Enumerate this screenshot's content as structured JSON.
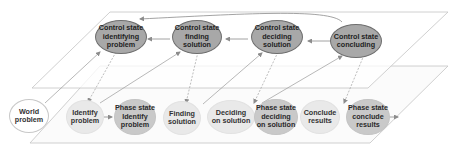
{
  "diagram": {
    "colors": {
      "control_fill": "#a8a8a8",
      "control_border": "#6e6e6e",
      "action_fill": "#e9e9e9",
      "phase_fill": "#c9c9c9",
      "world_fill": "#ffffff",
      "plane_stroke": "#c4c4c4",
      "arrow_stroke": "#8c8c8c"
    },
    "planes": [
      {
        "name": "control-plane",
        "label": ""
      },
      {
        "name": "phase-plane",
        "label": ""
      }
    ],
    "control_nodes": [
      {
        "id": "c1",
        "label": "Control state\nidentifying\nproblem"
      },
      {
        "id": "c2",
        "label": "Control state\nfinding\nsolution"
      },
      {
        "id": "c3",
        "label": "Control state\ndeciding\nsolution"
      },
      {
        "id": "c4",
        "label": "Control state\nconcluding"
      }
    ],
    "lower_nodes": [
      {
        "id": "w",
        "label": "World\nproblem",
        "kind": "world"
      },
      {
        "id": "a1",
        "label": "Identify\nproblem",
        "kind": "action"
      },
      {
        "id": "p1",
        "label": "Phase state\nIdentify\nproblem",
        "kind": "phase"
      },
      {
        "id": "a2",
        "label": "Finding\nsolution",
        "kind": "action"
      },
      {
        "id": "a3",
        "label": "Deciding\non solution",
        "kind": "action"
      },
      {
        "id": "p3",
        "label": "Phase state\ndeciding\non solution",
        "kind": "phase"
      },
      {
        "id": "a4",
        "label": "Conclude\nresults",
        "kind": "action"
      },
      {
        "id": "p4",
        "label": "Phase state\nconclude\nresults",
        "kind": "phase"
      }
    ],
    "edges": [
      {
        "from": "c4",
        "to": "c3"
      },
      {
        "from": "c3",
        "to": "c2"
      },
      {
        "from": "c2",
        "to": "c1"
      },
      {
        "from": "c4",
        "to": "c1",
        "curved": true
      },
      {
        "from": "w",
        "to": "c1"
      },
      {
        "from": "c1",
        "to": "a1",
        "dashed": true
      },
      {
        "from": "a1",
        "to": "p1"
      },
      {
        "from": "a1",
        "to": "c2"
      },
      {
        "from": "c2",
        "to": "a2",
        "dashed": true
      },
      {
        "from": "a2",
        "to": "c3"
      },
      {
        "from": "c3",
        "to": "a3",
        "dashed": true
      },
      {
        "from": "a3",
        "to": "p3"
      },
      {
        "from": "a3",
        "to": "c4"
      },
      {
        "from": "c4",
        "to": "a4",
        "dashed": true
      },
      {
        "from": "a4",
        "to": "p4"
      }
    ]
  }
}
